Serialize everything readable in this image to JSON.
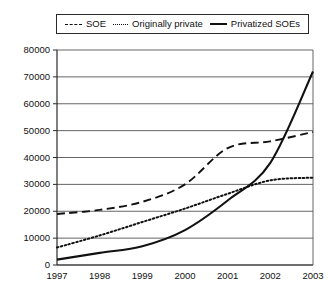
{
  "legend": {
    "position": "top-center",
    "entries": [
      {
        "label": "SOE",
        "style": "dashed",
        "icon": "dashed-line-icon"
      },
      {
        "label": "Originally private",
        "style": "dotted",
        "icon": "dotted-line-icon"
      },
      {
        "label": "Privatized SOEs",
        "style": "solid",
        "icon": "solid-line-icon"
      }
    ]
  },
  "chart_data": {
    "type": "line",
    "title": "",
    "subtitle": "",
    "xlabel": "",
    "ylabel": "",
    "x": [
      "1997",
      "1998",
      "1999",
      "2000",
      "2001",
      "2002",
      "2003"
    ],
    "categories": [
      "1997",
      "1998",
      "1999",
      "2000",
      "2001",
      "2002",
      "2003"
    ],
    "xlim": [
      1997,
      2003
    ],
    "ylim": [
      0,
      80000
    ],
    "ytick_labels": [
      "0",
      "10000",
      "20000",
      "30000",
      "40000",
      "50000",
      "60000",
      "70000",
      "80000"
    ],
    "ytick_values": [
      0,
      10000,
      20000,
      30000,
      40000,
      50000,
      60000,
      70000,
      80000
    ],
    "xtick_labels": [
      "1997",
      "1998",
      "1999",
      "2000",
      "2001",
      "2002",
      "2003"
    ],
    "grid": "horizontal",
    "legend_position": "top-center",
    "series": [
      {
        "name": "SOE",
        "style": "dashed",
        "color": "#111111",
        "values": [
          19000,
          20500,
          23500,
          30000,
          43500,
          46000,
          49500
        ]
      },
      {
        "name": "Originally private",
        "style": "dotted",
        "color": "#111111",
        "values": [
          6500,
          11000,
          16000,
          21000,
          26500,
          31500,
          32500
        ]
      },
      {
        "name": "Privatized SOEs",
        "style": "solid",
        "color": "#111111",
        "values": [
          2000,
          4500,
          7000,
          13000,
          24000,
          38000,
          72000
        ]
      }
    ]
  }
}
